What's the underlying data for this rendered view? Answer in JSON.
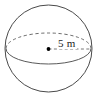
{
  "figure": {
    "name": "sphere-radius-diagram",
    "shape": "sphere",
    "background_color": "#ffffff",
    "outline_color": "#4a4a4a",
    "equator_color": "#5a5a5a",
    "radius_line_color": "#6a6a6a",
    "center_dot_color": "#000000",
    "label_color": "#1c1c1c",
    "radius_label": "5 m",
    "icons": {
      "sphere_outline": "circle-outline-icon",
      "equator_hidden": "dashed-ellipse-arc-icon",
      "equator_visible": "solid-ellipse-arc-icon",
      "center_point": "center-dot-icon",
      "radius_segment": "dashed-radius-line-icon"
    },
    "geometry": {
      "circle_center_x": 48.5,
      "circle_center_y": 48.5,
      "circle_radius": 43.5,
      "ellipse_rx": 42.5,
      "ellipse_ry": 15.5,
      "radius_line_x1": 48.5,
      "radius_line_y1": 49,
      "radius_line_x2": 91,
      "radius_line_y2": 49
    }
  }
}
